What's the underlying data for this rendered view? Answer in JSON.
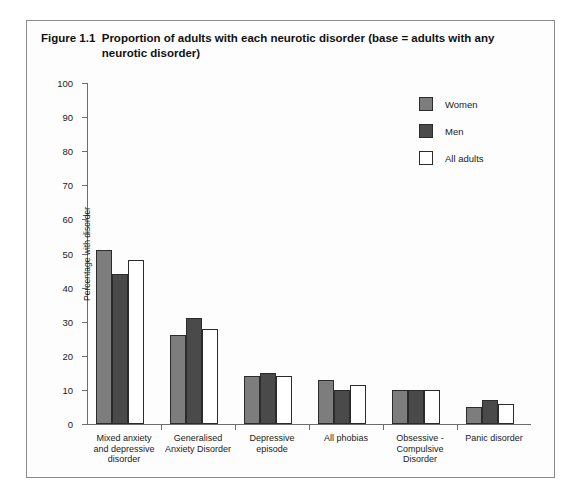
{
  "figure": {
    "number": "Figure 1.1",
    "title": "Proportion of adults with each neurotic disorder (base = adults with any neurotic disorder)"
  },
  "legend": {
    "position": "top-right",
    "items": [
      {
        "label": "Women",
        "color": "#7d7d7d"
      },
      {
        "label": "Men",
        "color": "#4a4a4a"
      },
      {
        "label": "All adults",
        "color": "#ffffff"
      }
    ]
  },
  "axes": {
    "ylabel": "Percentage with disorder",
    "xlabel": "",
    "yticks": [
      "0",
      "10",
      "20",
      "30",
      "40",
      "50",
      "60",
      "70",
      "80",
      "90",
      "100"
    ]
  },
  "chart_data": {
    "type": "bar",
    "xlabel": "",
    "ylabel": "Percentage with disorder",
    "ylim": [
      0,
      100
    ],
    "ytick_step": 10,
    "grid": false,
    "legend_position": "top-right",
    "categories": [
      "Mixed anxiety and depressive disorder",
      "Generalised Anxiety Disorder",
      "Depressive episode",
      "All phobias",
      "Obsessive - Compulsive Disorder",
      "Panic disorder"
    ],
    "category_lines": [
      [
        "Mixed anxiety",
        "and depressive",
        "disorder"
      ],
      [
        "Generalised",
        "Anxiety Disorder"
      ],
      [
        "Depressive",
        "episode"
      ],
      [
        "All phobias"
      ],
      [
        "Obsessive -",
        "Compulsive",
        "Disorder"
      ],
      [
        "Panic disorder"
      ]
    ],
    "series": [
      {
        "name": "Women",
        "color": "#7d7d7d",
        "values": [
          51,
          26,
          14,
          13,
          10,
          5
        ]
      },
      {
        "name": "Men",
        "color": "#4a4a4a",
        "values": [
          44,
          31,
          15,
          10,
          10,
          7
        ]
      },
      {
        "name": "All adults",
        "color": "#ffffff",
        "values": [
          48,
          28,
          14,
          11.5,
          10,
          6
        ]
      }
    ]
  }
}
